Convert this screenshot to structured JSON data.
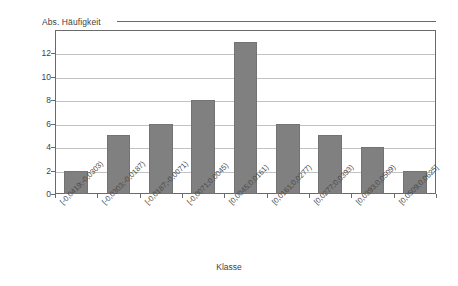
{
  "chart_data": {
    "type": "bar",
    "title": "",
    "ylabel": "Abs. Häufigkeit",
    "xlabel": "Klasse",
    "categories": [
      "[-0,0419;-0,0303)",
      "[-0,0303;-0,0187)",
      "[-0,0187;-0,0071)",
      "[-0,0071;0,0045)",
      "[0,0045;0,0161)",
      "[0,0161;0,0277)",
      "[0,0277;0,0393)",
      "[0,0393;0,0509)",
      "[0,0509;0,0625]"
    ],
    "values": [
      2,
      5,
      6,
      8,
      13,
      6,
      5,
      4,
      2
    ],
    "ylim": [
      0,
      14
    ],
    "ytick_labels": [
      "0",
      "2",
      "4",
      "6",
      "8",
      "10",
      "12"
    ],
    "ytick_values": [
      0,
      2,
      4,
      6,
      8,
      10,
      12
    ],
    "grid": "horizontal",
    "legend": "none",
    "bar_color": "#808080",
    "gridline_color": "#c2c2c2",
    "axis_color": "#6a6a6a",
    "background_color": "#ffffff"
  }
}
